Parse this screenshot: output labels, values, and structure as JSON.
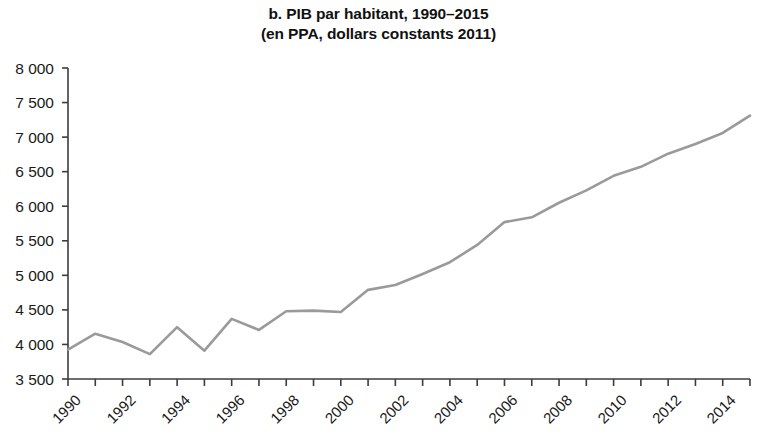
{
  "figure": {
    "title_line_1": "b. PIB par habitant, 1990–2015",
    "title_line_2": "(en PPA, dollars constants 2011)"
  },
  "chart_data": {
    "type": "line",
    "title": "b. PIB par habitant, 1990–2015 (en PPA, dollars constants 2011)",
    "subtitle": "(en PPA, dollars constants 2011)",
    "xlabel": "",
    "ylabel": "",
    "xlim": [
      1990,
      2015
    ],
    "ylim": [
      3500,
      8000
    ],
    "ytick_step": 500,
    "grid": false,
    "legend": null,
    "line_color": "#9a9a9a",
    "axis_color": "#3c3c3c",
    "x": [
      1990,
      1991,
      1992,
      1993,
      1994,
      1995,
      1996,
      1997,
      1998,
      1999,
      2000,
      2001,
      2002,
      2003,
      2004,
      2005,
      2006,
      2007,
      2008,
      2009,
      2010,
      2011,
      2012,
      2013,
      2014,
      2015
    ],
    "values": [
      3925,
      4155,
      4035,
      3860,
      4250,
      3910,
      4370,
      4210,
      4480,
      4490,
      4470,
      4790,
      4860,
      5020,
      5190,
      5440,
      5770,
      5840,
      6050,
      6230,
      6440,
      6570,
      6760,
      6900,
      7060,
      7310
    ],
    "series": [
      {
        "name": "PIB par habitant",
        "values": [
          3925,
          4155,
          4035,
          3860,
          4250,
          3910,
          4370,
          4210,
          4480,
          4490,
          4470,
          4790,
          4860,
          5020,
          5190,
          5440,
          5770,
          5840,
          6050,
          6230,
          6440,
          6570,
          6760,
          6900,
          7060,
          7310
        ]
      }
    ],
    "ytick_labels": [
      "8 000",
      "7 500",
      "7 000",
      "6 500",
      "6 000",
      "5 500",
      "5 000",
      "4 500",
      "4 000",
      "3 500"
    ],
    "ytick_values": [
      8000,
      7500,
      7000,
      6500,
      6000,
      5500,
      5000,
      4500,
      4000,
      3500
    ],
    "xtick_labels": [
      "1990",
      "1992",
      "1994",
      "1996",
      "1998",
      "2000",
      "2002",
      "2004",
      "2006",
      "2008",
      "2010",
      "2012",
      "2014"
    ],
    "xtick_values": [
      1990,
      1992,
      1994,
      1996,
      1998,
      2000,
      2002,
      2004,
      2006,
      2008,
      2010,
      2012,
      2014
    ],
    "xminor_values": [
      1991,
      1993,
      1995,
      1997,
      1999,
      2001,
      2003,
      2005,
      2007,
      2009,
      2011,
      2013,
      2015
    ]
  }
}
